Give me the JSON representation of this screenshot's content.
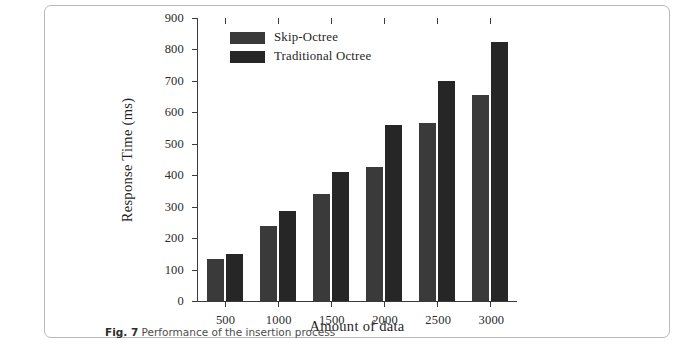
{
  "figure": {
    "caption_number": "Fig. 7",
    "caption_text": "Performance of the insertion process"
  },
  "chart_data": {
    "type": "bar",
    "title": "",
    "xlabel": "Amount of data",
    "ylabel": "Response Time (ms)",
    "categories": [
      "500",
      "1000",
      "1500",
      "2000",
      "2500",
      "3000"
    ],
    "series": [
      {
        "name": "Skip-Octree",
        "color": "#3a3a3a",
        "values": [
          135,
          240,
          340,
          425,
          565,
          655
        ]
      },
      {
        "name": "Traditional Octree",
        "color": "#262626",
        "values": [
          150,
          285,
          410,
          560,
          700,
          825
        ]
      }
    ],
    "ylim": [
      0,
      900
    ],
    "yticks": [
      "0",
      "100",
      "200",
      "300",
      "400",
      "500",
      "600",
      "700",
      "800",
      "900"
    ],
    "ytick_values": [
      0,
      100,
      200,
      300,
      400,
      500,
      600,
      700,
      800,
      900
    ],
    "grid": false,
    "legend_position": "top-left",
    "legend": [
      "Skip-Octree",
      "Traditional Octree"
    ]
  }
}
